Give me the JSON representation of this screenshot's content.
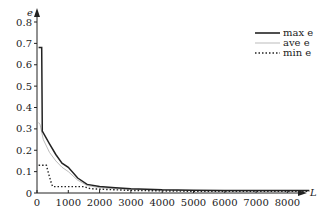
{
  "chart_data": {
    "type": "line",
    "title": "",
    "xlabel": "L",
    "ylabel": "e",
    "xlim": [
      0,
      8700
    ],
    "ylim": [
      0,
      0.85
    ],
    "grid": false,
    "legend_position": "upper right",
    "x_ticks": [
      0,
      1000,
      2000,
      3000,
      4000,
      5000,
      6000,
      7000,
      8000
    ],
    "x_tick_labels": [
      "0",
      "1000",
      "2000",
      "3000",
      "4000",
      "5000",
      "6000",
      "7000",
      "8000"
    ],
    "y_ticks": [
      0,
      0.1,
      0.2,
      0.3,
      0.4,
      0.5,
      0.6,
      0.7,
      0.8
    ],
    "y_tick_labels": [
      "0",
      "0.1",
      "0.2",
      "0.3",
      "0.4",
      "0.5",
      "0.6",
      "0.7",
      "0.8"
    ],
    "series": [
      {
        "name": "max e",
        "style": "solid-thick",
        "color": "#222222",
        "x": [
          50,
          150,
          170,
          400,
          600,
          800,
          1000,
          1300,
          1600,
          2000,
          2500,
          3000,
          4000,
          5000,
          6000,
          7000,
          8000,
          8700
        ],
        "y": [
          0.68,
          0.68,
          0.29,
          0.23,
          0.18,
          0.14,
          0.12,
          0.07,
          0.04,
          0.03,
          0.025,
          0.02,
          0.015,
          0.013,
          0.012,
          0.012,
          0.012,
          0.012
        ]
      },
      {
        "name": "ave e",
        "style": "solid-thin",
        "color": "#aaaaaa",
        "x": [
          50,
          100,
          200,
          400,
          600,
          800,
          1000,
          1300,
          1600,
          2000,
          2500,
          3000,
          4000,
          5000,
          6000,
          7000,
          8000,
          8700
        ],
        "y": [
          0.33,
          0.32,
          0.25,
          0.19,
          0.15,
          0.12,
          0.1,
          0.06,
          0.035,
          0.025,
          0.02,
          0.017,
          0.013,
          0.011,
          0.01,
          0.01,
          0.01,
          0.01
        ]
      },
      {
        "name": "min e",
        "style": "dotted",
        "color": "#222222",
        "x": [
          50,
          300,
          350,
          450,
          500,
          1000,
          1500,
          1700,
          2000,
          2500,
          3000,
          4000,
          5000,
          6000,
          7000,
          8000,
          8700
        ],
        "y": [
          0.13,
          0.13,
          0.1,
          0.05,
          0.03,
          0.03,
          0.03,
          0.02,
          0.018,
          0.015,
          0.012,
          0.01,
          0.008,
          0.008,
          0.008,
          0.008,
          0.008
        ]
      }
    ]
  },
  "legend": {
    "items": [
      {
        "label": "max e"
      },
      {
        "label": "ave e"
      },
      {
        "label": "min e"
      }
    ]
  }
}
